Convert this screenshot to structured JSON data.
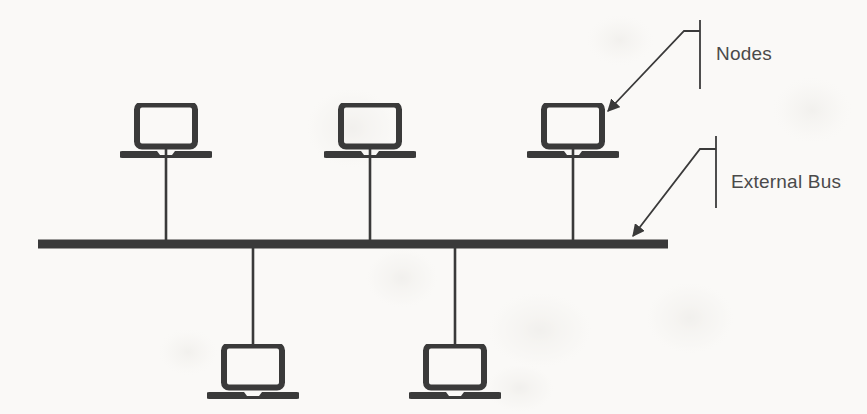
{
  "diagram": {
    "background_color": "#faf9f7",
    "stroke_color": "#3a3a3a",
    "text_color": "#4a4a4a",
    "labels": {
      "nodes": "Nodes",
      "external_bus": "External Bus"
    },
    "icons": {
      "laptop": "laptop-icon",
      "arrow": "arrow-icon",
      "bus": "bus-bar"
    },
    "bus": {
      "name": "external-bus-bar",
      "x_start": 38,
      "x_end": 668,
      "y": 240,
      "thickness": 9
    },
    "nodes": [
      {
        "id": "node-top-1",
        "label": "Node 1",
        "position": "top",
        "cx": 166,
        "cy": 124,
        "drop_to": 240
      },
      {
        "id": "node-top-2",
        "label": "Node 2",
        "position": "top",
        "cx": 370,
        "cy": 124,
        "drop_to": 240
      },
      {
        "id": "node-top-3",
        "label": "Node 3",
        "position": "top",
        "cx": 573,
        "cy": 124,
        "drop_to": 240
      },
      {
        "id": "node-bottom-1",
        "label": "Node 4",
        "position": "bottom",
        "cx": 253,
        "cy": 370,
        "drop_to": 248
      },
      {
        "id": "node-bottom-2",
        "label": "Node 5",
        "position": "bottom",
        "cx": 455,
        "cy": 370,
        "drop_to": 248
      }
    ],
    "callouts": [
      {
        "id": "callout-nodes",
        "label": "Nodes",
        "bracket_x": 700,
        "bracket_y_top": 20,
        "bracket_y_bottom": 89,
        "elbow_y": 31,
        "elbow_x": 684,
        "arrow_x": 604,
        "arrow_y": 113
      },
      {
        "id": "callout-external-bus",
        "label": "External Bus",
        "bracket_x": 716,
        "bracket_y_top": 136,
        "bracket_y_bottom": 208,
        "elbow_y": 149,
        "elbow_x": 700,
        "arrow_x": 629,
        "arrow_y": 238
      }
    ]
  }
}
